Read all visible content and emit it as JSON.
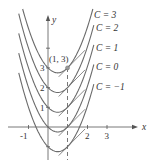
{
  "figure": {
    "axes": {
      "x_label": "x",
      "y_label": "y",
      "x_ticks": [
        "-1",
        "2",
        "3"
      ],
      "y_ticks": [
        "1",
        "2",
        "3"
      ]
    },
    "point_label": "(1, 3)",
    "curve_labels": [
      "C = 3",
      "C = 2",
      "C = 1",
      "C = 0",
      "C = −1"
    ],
    "curve_constants": [
      3,
      2,
      1,
      0,
      -1
    ],
    "colors": {
      "curves": "#6b6b6b",
      "axes": "#555555",
      "point": "#888888"
    }
  },
  "chart_data": {
    "type": "line",
    "title": "",
    "xlabel": "x",
    "ylabel": "y",
    "xlim": [
      -1.3,
      3.5
    ],
    "ylim": [
      -1.5,
      5.8
    ],
    "series": [
      {
        "name": "C = 3",
        "function": "x^2 - x + 3",
        "tangent_at": [
          1,
          3
        ],
        "tangent_slope": 1
      },
      {
        "name": "C = 2",
        "function": "x^2 - x + 2",
        "tangent_at": [
          1,
          2
        ],
        "tangent_slope": 1
      },
      {
        "name": "C = 1",
        "function": "x^2 - x + 1",
        "tangent_at": [
          1,
          1
        ],
        "tangent_slope": 1
      },
      {
        "name": "C = 0",
        "function": "x^2 - x",
        "tangent_at": [
          1,
          0
        ],
        "tangent_slope": 1
      },
      {
        "name": "C = -1",
        "function": "x^2 - x - 1",
        "tangent_at": [
          1,
          -1
        ],
        "tangent_slope": 1
      }
    ],
    "annotations": [
      "(1, 3)",
      "dashed vertical line at x = 1"
    ],
    "grid": false
  }
}
